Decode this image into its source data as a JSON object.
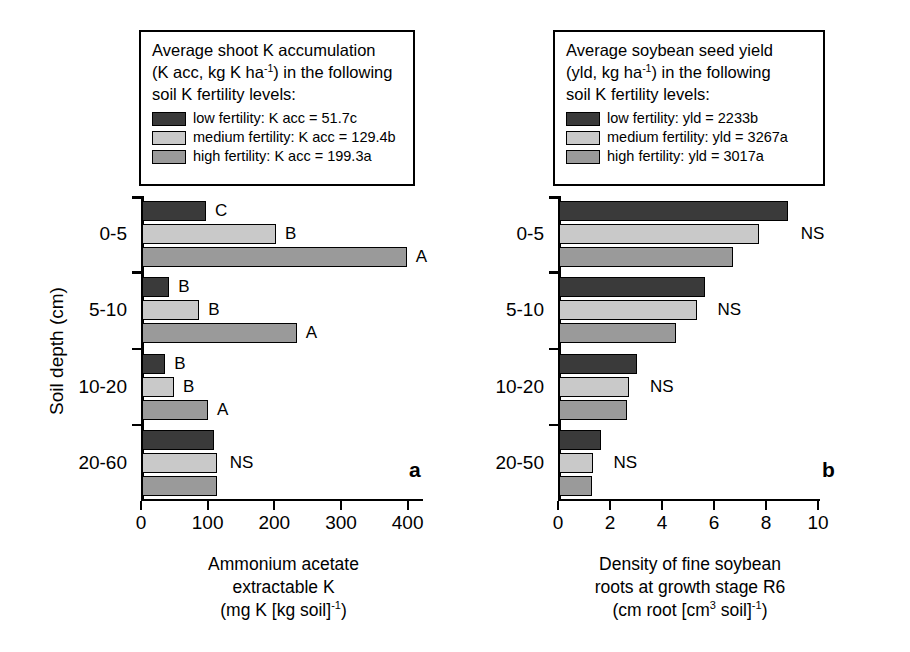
{
  "figure": {
    "width": 910,
    "height": 652,
    "background": "#ffffff"
  },
  "series_colors": {
    "low_fertility": "#3a3a3a",
    "medium_fertility": "#c9c9c9",
    "high_fertility": "#9a9a9a",
    "axis": "#000000"
  },
  "panel_a": {
    "letter": "a",
    "legend": {
      "title_line1": "Average shoot K accumulation",
      "title_line2_pre": "(K acc, kg K ha",
      "title_line2_sup": "-1",
      "title_line2_post": ") in the following",
      "title_line3": "soil K fertility levels:",
      "entries": [
        {
          "key": "low",
          "label": "low fertility: K acc = 51.7c",
          "color": "#3a3a3a"
        },
        {
          "key": "medium",
          "label": "medium fertility: K acc = 129.4b",
          "color": "#c9c9c9"
        },
        {
          "key": "high",
          "label": "high fertility: K acc = 199.3a",
          "color": "#9a9a9a"
        }
      ]
    },
    "ytitle": "Soil depth (cm)",
    "xtitle_line1": "Ammonium acetate",
    "xtitle_line2": "extractable K",
    "xtitle_line3_pre": "(mg K [kg soil]",
    "xtitle_line3_sup": "-1",
    "xtitle_line3_post": ")"
  },
  "panel_b": {
    "letter": "b",
    "legend": {
      "title_line1": "Average soybean seed yield",
      "title_line2_pre": "(yld, kg ha",
      "title_line2_sup": "-1",
      "title_line2_post": ") in the following",
      "title_line3": "soil K fertility levels:",
      "entries": [
        {
          "key": "low",
          "label": "low fertility: yld = 2233b",
          "color": "#3a3a3a"
        },
        {
          "key": "medium",
          "label": "medium fertility: yld = 3267a",
          "color": "#c9c9c9"
        },
        {
          "key": "high",
          "label": "high fertility: yld = 3017a",
          "color": "#9a9a9a"
        }
      ]
    },
    "xtitle_line1": "Density of fine soybean",
    "xtitle_line2": "roots at growth stage R6",
    "xtitle_line3_pre": "(cm root [cm",
    "xtitle_line3_sup3": "3",
    "xtitle_line3_mid": " soil]",
    "xtitle_line3_sup": "-1",
    "xtitle_line3_post": ")"
  },
  "chart_data": [
    {
      "id": "panel-a",
      "type": "bar",
      "orientation": "horizontal",
      "title": "",
      "xlabel": "Ammonium acetate extractable K (mg K [kg soil] -1)",
      "ylabel": "Soil depth (cm)",
      "categories": [
        "0-5",
        "5-10",
        "10-20",
        "20-60"
      ],
      "xlim": [
        0,
        420
      ],
      "xticks": [
        0,
        100,
        200,
        300,
        400
      ],
      "xticklabels": [
        "0",
        "100",
        "200",
        "300",
        "400"
      ],
      "grid": false,
      "legend_position": "above-plot",
      "series": [
        {
          "name": "low fertility",
          "color": "#3a3a3a",
          "values": [
            96,
            41,
            35,
            108
          ]
        },
        {
          "name": "medium fertility",
          "color": "#c9c9c9",
          "values": [
            201,
            86,
            48,
            112
          ]
        },
        {
          "name": "high fertility",
          "color": "#9a9a9a",
          "values": [
            397,
            232,
            99,
            112
          ]
        }
      ],
      "annotations": [
        {
          "category": "0-5",
          "series": "low fertility",
          "text": "C"
        },
        {
          "category": "0-5",
          "series": "medium fertility",
          "text": "B"
        },
        {
          "category": "0-5",
          "series": "high fertility",
          "text": "A"
        },
        {
          "category": "5-10",
          "series": "low fertility",
          "text": "B"
        },
        {
          "category": "5-10",
          "series": "medium fertility",
          "text": "B"
        },
        {
          "category": "5-10",
          "series": "high fertility",
          "text": "A"
        },
        {
          "category": "10-20",
          "series": "low fertility",
          "text": "B"
        },
        {
          "category": "10-20",
          "series": "medium fertility",
          "text": "B"
        },
        {
          "category": "10-20",
          "series": "high fertility",
          "text": "A"
        },
        {
          "category": "20-60",
          "series": "group",
          "text": "NS"
        }
      ]
    },
    {
      "id": "panel-b",
      "type": "bar",
      "orientation": "horizontal",
      "title": "",
      "xlabel": "Density of fine soybean roots at growth stage R6 (cm root [cm3 soil]-1)",
      "ylabel": "Soil depth (cm)",
      "categories": [
        "0-5",
        "5-10",
        "10-20",
        "20-50"
      ],
      "xlim": [
        0,
        10
      ],
      "xticks": [
        0,
        2,
        4,
        6,
        8,
        10
      ],
      "xticklabels": [
        "0",
        "2",
        "4",
        "6",
        "8",
        "10"
      ],
      "grid": false,
      "legend_position": "above-plot",
      "series": [
        {
          "name": "low fertility",
          "color": "#3a3a3a",
          "values": [
            8.8,
            5.6,
            3.0,
            1.6
          ]
        },
        {
          "name": "medium fertility",
          "color": "#c9c9c9",
          "values": [
            7.7,
            5.3,
            2.7,
            1.3
          ]
        },
        {
          "name": "high fertility",
          "color": "#9a9a9a",
          "values": [
            6.7,
            4.5,
            2.6,
            1.25
          ]
        }
      ],
      "annotations": [
        {
          "category": "0-5",
          "series": "group",
          "text": "NS"
        },
        {
          "category": "5-10",
          "series": "group",
          "text": "NS"
        },
        {
          "category": "10-20",
          "series": "group",
          "text": "NS"
        },
        {
          "category": "20-50",
          "series": "group",
          "text": "NS"
        }
      ]
    }
  ]
}
